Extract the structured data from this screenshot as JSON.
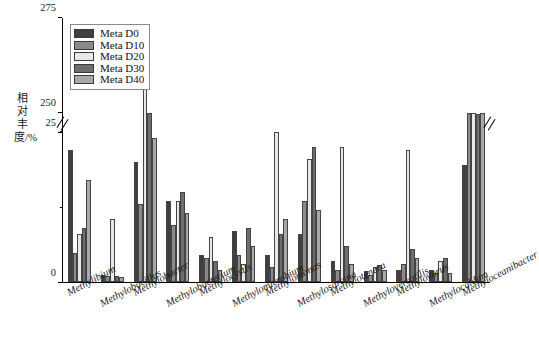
{
  "chart_data": {
    "type": "bar",
    "title": "",
    "xlabel": "",
    "ylabel": "相对丰度/%",
    "ylim": [
      0,
      275
    ],
    "broken_axis": {
      "lower_range": [
        0,
        25
      ],
      "upper_range": [
        250,
        275
      ],
      "break_between": [
        25,
        250
      ]
    },
    "ytick_labels": [
      "0",
      "25",
      "250",
      "275"
    ],
    "grid": false,
    "legend_position": "top-left",
    "categories": [
      "Methylibium",
      "Methylobacillus",
      "Methylobacter",
      "Methylobacterium",
      "Methylocystis",
      "Methylomicrobium",
      "Methylomonas",
      "Methylosarcina",
      "Methylotenera",
      "Methyloversatilis",
      "Methylovorus",
      "Methylocaldum",
      "Methyloceanibacter"
    ],
    "series": [
      {
        "name": "Meta D0",
        "color": "#3f3f3f",
        "values": [
          22.0,
          1.2,
          20.0,
          13.5,
          4.5,
          8.5,
          4.5,
          8.0,
          3.5,
          1.8,
          2.0,
          2.0,
          19.5
        ]
      },
      {
        "name": "Meta D10",
        "color": "#8a8a8a",
        "values": [
          4.8,
          1.0,
          13.0,
          9.5,
          4.0,
          4.5,
          2.5,
          13.5,
          2.0,
          1.2,
          3.0,
          1.5,
          248.0
        ]
      },
      {
        "name": "Meta D20",
        "color": "#e8e8e8",
        "values": [
          8.0,
          10.5,
          272.0,
          13.5,
          7.5,
          3.0,
          31.0,
          20.5,
          22.5,
          2.5,
          22.0,
          3.5,
          244.0
        ]
      },
      {
        "name": "Meta D30",
        "color": "#6e6e6e",
        "values": [
          9.0,
          1.0,
          249.0,
          15.0,
          3.5,
          9.0,
          8.0,
          22.5,
          6.0,
          2.8,
          5.5,
          4.0,
          236.0
        ]
      },
      {
        "name": "Meta D40",
        "color": "#a8a8a8",
        "values": [
          17.0,
          0.8,
          24.0,
          11.5,
          2.0,
          6.0,
          10.5,
          12.0,
          3.0,
          2.0,
          4.0,
          1.5,
          241.0
        ]
      }
    ]
  },
  "legend": {
    "items": [
      {
        "label": "Meta D0"
      },
      {
        "label": "Meta D10"
      },
      {
        "label": "Meta D20"
      },
      {
        "label": "Meta D30"
      },
      {
        "label": "Meta D40"
      }
    ]
  }
}
